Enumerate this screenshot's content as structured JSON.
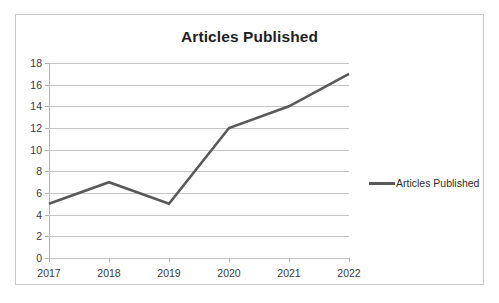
{
  "chart_data": {
    "type": "line",
    "title": "Articles Published",
    "xlabel": "",
    "ylabel": "",
    "categories": [
      "2017",
      "2018",
      "2019",
      "2020",
      "2021",
      "2022"
    ],
    "series": [
      {
        "name": "Articles Published",
        "values": [
          5,
          7,
          5,
          12,
          14,
          17
        ],
        "color": "#595959"
      }
    ],
    "ylim": [
      0,
      18
    ],
    "ytick_step": 2,
    "yticks": [
      "18",
      "16",
      "14",
      "12",
      "10",
      "8",
      "6",
      "4",
      "2",
      "0"
    ],
    "grid": "horizontal",
    "legend_position": "right",
    "legend_entries": [
      "Articles Published"
    ]
  },
  "legend": {
    "label": "Articles Published",
    "swatch_name": "line-swatch"
  },
  "colors": {
    "series_line": "#595959",
    "gridline": "#c5c5c5",
    "axis": "#b0b0b0",
    "frame_border": "#c9c9c9",
    "background": "#ffffff",
    "text": "#2b2b2b"
  }
}
